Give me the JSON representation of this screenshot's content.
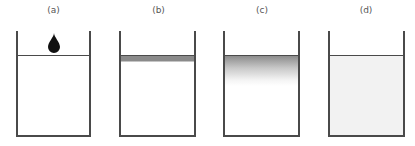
{
  "diagram": {
    "panels": [
      {
        "label": "(a)",
        "state": "ink drop above water surface",
        "fill": "#ffffff"
      },
      {
        "label": "(b)",
        "state": "thin ink layer at surface",
        "band_color": "#8a8a8a"
      },
      {
        "label": "(c)",
        "state": "ink spreading downward as gradient",
        "gradient_top": "#8c8c8c",
        "gradient_bottom": "#ffffff"
      },
      {
        "label": "(d)",
        "state": "ink uniformly dispersed",
        "fill": "#f2f2f2"
      }
    ],
    "stroke_color": "#4a4a4a",
    "drop_color": "#111111"
  }
}
